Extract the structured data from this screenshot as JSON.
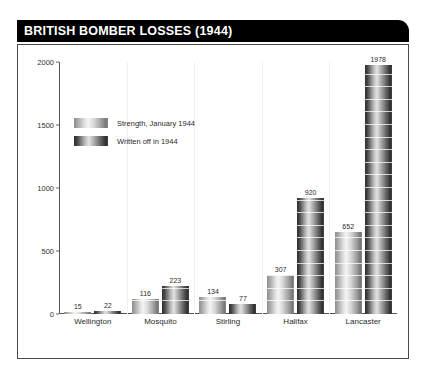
{
  "header": {
    "title": "BRITISH BOMBER LOSSES (1944)",
    "bar_color": "#000000",
    "text_color": "#ffffff"
  },
  "chart_data": {
    "type": "bar",
    "title": "BRITISH BOMBER LOSSES (1944)",
    "xlabel": "",
    "ylabel": "",
    "ylim": [
      0,
      2000
    ],
    "yticks": [
      0,
      500,
      1000,
      1500,
      2000
    ],
    "ytick_labels": [
      "0",
      "500",
      "1000",
      "1500",
      "2000"
    ],
    "grid": true,
    "legend_position": "upper-left",
    "categories": [
      "Wellington",
      "Mosquito",
      "Stirling",
      "Halifax",
      "Lancaster"
    ],
    "series": [
      {
        "name": "Strength, January 1944",
        "values": [
          15,
          116,
          134,
          307,
          652
        ],
        "color": "#b5b5b5"
      },
      {
        "name": "Written off in 1944",
        "values": [
          22,
          223,
          77,
          920,
          1978
        ],
        "color": "#4a4a4a"
      }
    ]
  }
}
